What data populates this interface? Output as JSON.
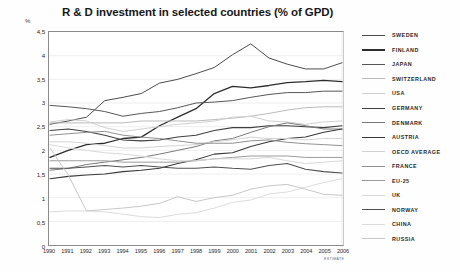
{
  "header": {
    "title": "R & D investment in selected countries (% of GPD)"
  },
  "axes": {
    "y_unit": "%",
    "y_ticks": [
      "4,5",
      "4",
      "3,5",
      "3",
      "2,5",
      "2",
      "1,5",
      "1",
      "0,5",
      "0"
    ],
    "x_ticks": [
      "1990",
      "1991",
      "1992",
      "1993",
      "1994",
      "1995",
      "1996",
      "1997",
      "1998",
      "1999",
      "2000",
      "2001",
      "2002",
      "2003",
      "2004",
      "2005",
      "2006"
    ],
    "estimate_note": "ESTIMATE"
  },
  "chart_data": {
    "type": "line",
    "title": "R & D investment in selected countries (% of GPD)",
    "xlabel": "",
    "ylabel": "%",
    "ylim": [
      0,
      4.5
    ],
    "xlim": [
      1990,
      2006
    ],
    "grid": true,
    "legend_position": "right",
    "x": [
      1990,
      1991,
      1992,
      1993,
      1994,
      1995,
      1996,
      1997,
      1998,
      1999,
      2000,
      2001,
      2002,
      2003,
      2004,
      2005,
      2006
    ],
    "series": [
      {
        "name": "SWEDEN",
        "color": "#4a4a4a",
        "width": 1.0,
        "values": [
          2.55,
          2.62,
          2.7,
          3.05,
          3.12,
          3.2,
          3.42,
          3.5,
          3.62,
          3.75,
          4.02,
          4.25,
          3.95,
          3.82,
          3.72,
          3.72,
          3.85
        ]
      },
      {
        "name": "FINLAND",
        "color": "#2d2d2d",
        "width": 1.3,
        "values": [
          1.85,
          2.0,
          2.12,
          2.15,
          2.25,
          2.28,
          2.52,
          2.7,
          2.88,
          3.2,
          3.35,
          3.32,
          3.37,
          3.43,
          3.45,
          3.48,
          3.45
        ]
      },
      {
        "name": "JAPAN",
        "color": "#555555",
        "width": 1.0,
        "values": [
          2.95,
          2.92,
          2.88,
          2.82,
          2.72,
          2.78,
          2.82,
          2.9,
          3.0,
          3.02,
          3.05,
          3.12,
          3.18,
          3.22,
          3.22,
          3.25,
          3.25
        ]
      },
      {
        "name": "SWITZERLAND",
        "color": "#b9b9b9",
        "width": 1.0,
        "values": [
          2.58,
          2.58,
          2.58,
          2.58,
          2.58,
          2.62,
          2.62,
          2.62,
          2.62,
          2.65,
          2.68,
          2.72,
          2.78,
          2.85,
          2.9,
          2.92,
          2.92
        ]
      },
      {
        "name": "USA",
        "color": "#cfcfcf",
        "width": 1.0,
        "values": [
          2.6,
          2.65,
          2.62,
          2.48,
          2.4,
          2.45,
          2.5,
          2.55,
          2.58,
          2.62,
          2.7,
          2.72,
          2.62,
          2.6,
          2.55,
          2.6,
          2.62
        ]
      },
      {
        "name": "GERMANY",
        "color": "#3f3f3f",
        "width": 1.05,
        "values": [
          2.42,
          2.45,
          2.4,
          2.32,
          2.22,
          2.2,
          2.22,
          2.28,
          2.32,
          2.42,
          2.48,
          2.48,
          2.52,
          2.52,
          2.5,
          2.48,
          2.52
        ]
      },
      {
        "name": "DENMARK",
        "color": "#777777",
        "width": 1.0,
        "values": [
          1.58,
          1.62,
          1.7,
          1.75,
          1.8,
          1.85,
          1.92,
          2.0,
          2.08,
          2.2,
          2.25,
          2.38,
          2.5,
          2.58,
          2.52,
          2.45,
          2.45
        ]
      },
      {
        "name": "AUSTRIA",
        "color": "#383838",
        "width": 1.05,
        "values": [
          1.4,
          1.45,
          1.48,
          1.5,
          1.55,
          1.58,
          1.62,
          1.72,
          1.8,
          1.92,
          1.95,
          2.08,
          2.18,
          2.25,
          2.28,
          2.38,
          2.45
        ]
      },
      {
        "name": "OECD AVERAGE",
        "color": "#d2d2d2",
        "width": 1.0,
        "values": [
          2.18,
          2.18,
          2.15,
          2.1,
          2.05,
          2.05,
          2.08,
          2.1,
          2.12,
          2.18,
          2.22,
          2.28,
          2.25,
          2.25,
          2.22,
          2.25,
          2.25
        ]
      },
      {
        "name": "FRANCE",
        "color": "#909090",
        "width": 1.0,
        "values": [
          2.32,
          2.35,
          2.38,
          2.4,
          2.32,
          2.28,
          2.25,
          2.2,
          2.15,
          2.15,
          2.15,
          2.2,
          2.22,
          2.17,
          2.14,
          2.12,
          2.1
        ]
      },
      {
        "name": "EU-25",
        "color": "#9a9a9a",
        "width": 1.0,
        "values": [
          1.78,
          1.78,
          1.78,
          1.78,
          1.75,
          1.75,
          1.75,
          1.75,
          1.78,
          1.82,
          1.85,
          1.88,
          1.88,
          1.88,
          1.85,
          1.85,
          1.85
        ]
      },
      {
        "name": "UK",
        "color": "#d8d8d8",
        "width": 1.0,
        "values": [
          2.12,
          2.05,
          2.0,
          1.95,
          1.92,
          1.88,
          1.82,
          1.78,
          1.78,
          1.82,
          1.82,
          1.82,
          1.85,
          1.78,
          1.72,
          1.75,
          1.78
        ]
      },
      {
        "name": "NORWAY",
        "color": "#505050",
        "width": 1.05,
        "values": [
          1.62,
          1.62,
          1.65,
          1.68,
          1.65,
          1.68,
          1.65,
          1.62,
          1.62,
          1.65,
          1.62,
          1.6,
          1.68,
          1.72,
          1.6,
          1.55,
          1.52
        ]
      },
      {
        "name": "CHINA",
        "color": "#dcdcdc",
        "width": 1.0,
        "values": [
          0.7,
          0.72,
          0.72,
          0.7,
          0.65,
          0.6,
          0.58,
          0.65,
          0.68,
          0.78,
          0.9,
          0.95,
          1.08,
          1.12,
          1.22,
          1.32,
          1.4
        ]
      },
      {
        "name": "RUSSIA",
        "color": "#c6c6c6",
        "width": 1.0,
        "values": [
          2.05,
          1.48,
          0.72,
          0.75,
          0.78,
          0.82,
          0.88,
          1.02,
          0.92,
          1.0,
          1.05,
          1.18,
          1.25,
          1.28,
          1.18,
          1.07,
          1.05
        ]
      }
    ]
  },
  "legend": {
    "items": [
      {
        "label": "SWEDEN",
        "color": "#4a4a4a",
        "weight": 1.6
      },
      {
        "label": "FINLAND",
        "color": "#2d2d2d",
        "weight": 2.2
      },
      {
        "label": "JAPAN",
        "color": "#555555",
        "weight": 1.6
      },
      {
        "label": "SWITZERLAND",
        "color": "#b9b9b9",
        "weight": 1.6
      },
      {
        "label": "USA",
        "color": "#cfcfcf",
        "weight": 1.6
      },
      {
        "label": "GERMANY",
        "color": "#3f3f3f",
        "weight": 1.8
      },
      {
        "label": "DENMARK",
        "color": "#777777",
        "weight": 1.6
      },
      {
        "label": "AUSTRIA",
        "color": "#383838",
        "weight": 1.8
      },
      {
        "label": "OECD AVERAGE",
        "color": "#d2d2d2",
        "weight": 1.6
      },
      {
        "label": "FRANCE",
        "color": "#909090",
        "weight": 1.6
      },
      {
        "label": "EU-25",
        "color": "#9a9a9a",
        "weight": 1.6
      },
      {
        "label": "UK",
        "color": "#d8d8d8",
        "weight": 1.6
      },
      {
        "label": "NORWAY",
        "color": "#505050",
        "weight": 1.8
      },
      {
        "label": "CHINA",
        "color": "#dcdcdc",
        "weight": 1.6
      },
      {
        "label": "RUSSIA",
        "color": "#c6c6c6",
        "weight": 1.6
      }
    ]
  }
}
